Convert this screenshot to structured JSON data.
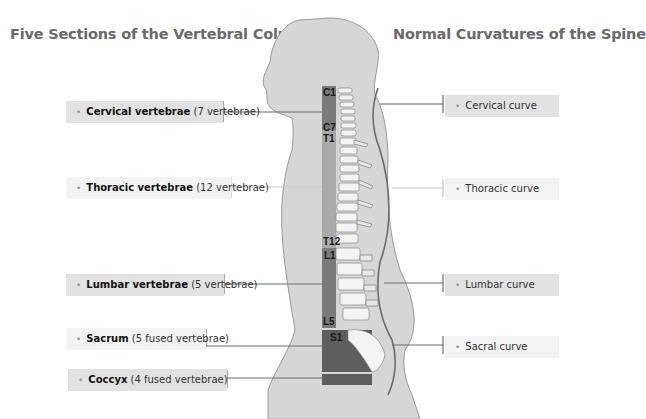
{
  "titles": {
    "left": "Five Sections of the Vertebral Column",
    "right": "Normal Curvatures of the Spine"
  },
  "sections": [
    {
      "name": "Cervical vertebrae",
      "note": "(7 vertebrae)",
      "style": "strong",
      "color": "#7a7a7a"
    },
    {
      "name": "Thoracic vertebrae",
      "note": "(12 vertebrae)",
      "style": "light",
      "color": "#a9a9a9"
    },
    {
      "name": "Lumbar vertebrae",
      "note": "(5 vertebrae)",
      "style": "strong",
      "color": "#7a7a7a"
    },
    {
      "name": "Sacrum",
      "note": "(5 fused vertebrae)",
      "style": "light",
      "color": "#5e5e5e"
    },
    {
      "name": "Coccyx",
      "note": "(4 fused vertebrae)",
      "style": "strong",
      "color": "#5e5e5e"
    }
  ],
  "curves": [
    {
      "name": "Cervical curve",
      "style": "strong"
    },
    {
      "name": "Thoracic curve",
      "style": "light"
    },
    {
      "name": "Lumbar curve",
      "style": "strong"
    },
    {
      "name": "Sacral curve",
      "style": "light"
    }
  ],
  "vertebra_markers": [
    "C1",
    "C7",
    "T1",
    "T12",
    "L1",
    "L5",
    "S1"
  ],
  "bullet": "•",
  "colors": {
    "body_fill": "#d6d6d6",
    "body_outline": "#9a9a9a",
    "leader_dark": "#6d6d6d",
    "leader_light": "#c8c8c8",
    "bone": "#f4f4f4"
  }
}
